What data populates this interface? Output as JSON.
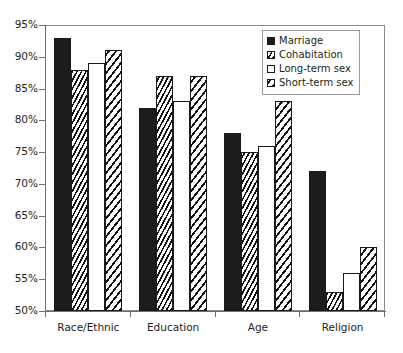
{
  "chart_data": {
    "type": "bar",
    "title": "",
    "xlabel": "",
    "ylabel": "",
    "ylim": [
      50,
      95
    ],
    "ytick_labels": [
      "95%",
      "90%",
      "85%",
      "80%",
      "75%",
      "70%",
      "65%",
      "60%",
      "55%",
      "50%"
    ],
    "ytick_values": [
      95,
      90,
      85,
      80,
      75,
      70,
      65,
      60,
      55,
      50
    ],
    "grid": false,
    "legend_position": "top-right",
    "categories": [
      "Race/Ethnic",
      "Education",
      "Age",
      "Religion"
    ],
    "series": [
      {
        "name": "Marriage",
        "values": [
          93,
          82,
          78,
          72
        ]
      },
      {
        "name": "Cohabitation",
        "values": [
          88,
          87,
          75,
          53
        ]
      },
      {
        "name": "Long-term sex",
        "values": [
          89,
          83,
          76,
          56
        ]
      },
      {
        "name": "Short-term sex",
        "values": [
          91,
          87,
          83,
          60
        ]
      }
    ],
    "series_styles": [
      "fill-solid",
      "fill-hatch-dense",
      "fill-white",
      "fill-hatch-wide"
    ]
  },
  "legend": {
    "items": [
      {
        "label": "Marriage"
      },
      {
        "label": "Cohabitation"
      },
      {
        "label": "Long-term sex"
      },
      {
        "label": "Short-term sex"
      }
    ]
  },
  "colors": {
    "bar_solid": "#1c1c1c",
    "bar_white": "#ffffff",
    "hatch_line": "#111111",
    "axis": "#6e6e6e",
    "frame": "#8a8a8a",
    "text": "#231f20",
    "background": "#ffffff"
  }
}
